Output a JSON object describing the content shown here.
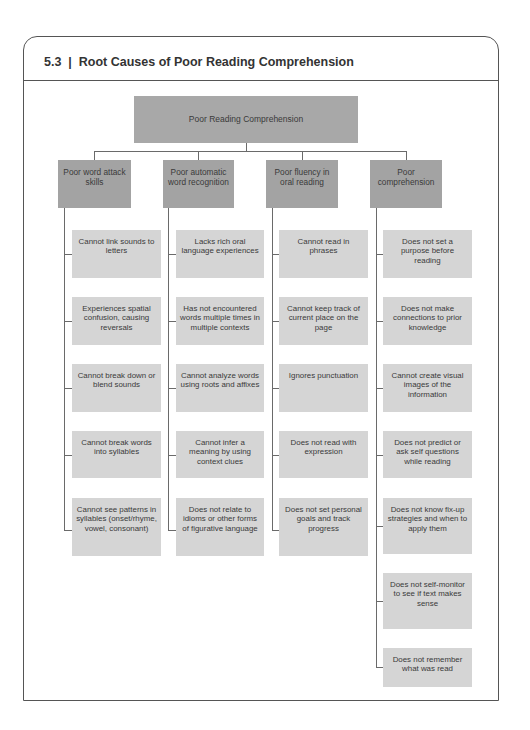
{
  "header": {
    "figure_number": "5.3",
    "separator": "|",
    "title": "Root Causes of Poor Reading Comprehension"
  },
  "diagram": {
    "root": {
      "label": "Poor Reading Comprehension"
    },
    "categories": [
      {
        "label": "Poor word attack skills",
        "causes": [
          "Cannot link sounds to letters",
          "Experiences spatial confusion, causing reversals",
          "Cannot break down or blend sounds",
          "Cannot break words into syllables",
          "Cannot see patterns in syllables (onset/rhyme, vowel, consonant)"
        ]
      },
      {
        "label": "Poor automatic word recognition",
        "causes": [
          "Lacks rich oral language experiences",
          "Has not encountered words multiple times in multiple contexts",
          "Cannot analyze words using roots and affixes",
          "Cannot infer a meaning by using context clues",
          "Does not relate to idioms or other forms of figurative language"
        ]
      },
      {
        "label": "Poor fluency in oral reading",
        "causes": [
          "Cannot read in phrases",
          "Cannot keep track of current place on the page",
          "Ignores punctuation",
          "Does not read with expression",
          "Does not set personal goals and track progress"
        ]
      },
      {
        "label": "Poor comprehension",
        "causes": [
          "Does not set a purpose before reading",
          "Does not make connections to prior knowledge",
          "Cannot create visual images of the information",
          "Does not predict or ask self questions while reading",
          "Does not know fix-up strategies and when to apply them",
          "Does not self-monitor to see if text makes sense",
          "Does not remember what was read"
        ]
      }
    ]
  },
  "colors": {
    "root_fill": "#a8a8a8",
    "category_fill": "#a3a3a3",
    "leaf_fill": "#d5d5d5",
    "line": "#6a6a6a",
    "frame": "#555555"
  }
}
